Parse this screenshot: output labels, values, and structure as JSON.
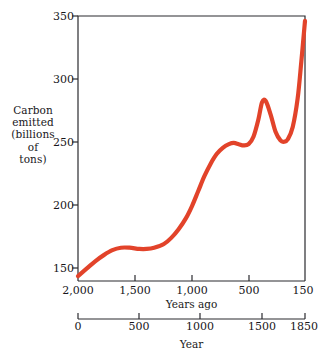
{
  "chart_data": {
    "type": "line",
    "title": "",
    "ylabel": "Carbon emitted (billions of tons)",
    "ylabel_lines": [
      "Carbon",
      "emitted",
      "(billions",
      "of",
      "tons)"
    ],
    "ylim": [
      137,
      352
    ],
    "yticks": [
      150,
      200,
      250,
      300,
      350
    ],
    "ytick_labels": [
      "150",
      "200",
      "250",
      "300",
      "350"
    ],
    "grid": false,
    "legend": null,
    "axes": [
      {
        "name": "years-ago",
        "position": "top-of-caption",
        "label": "Years ago",
        "ticks": [
          2000,
          1500,
          1000,
          500,
          150
        ],
        "tick_labels": [
          "2,000",
          "1,500",
          "1,000",
          "500",
          "150"
        ],
        "direction": "decreasing"
      },
      {
        "name": "year",
        "position": "bottom",
        "label": "Year",
        "ticks": [
          0,
          500,
          1000,
          1500,
          1850
        ],
        "tick_labels": [
          "0",
          "500",
          "1000",
          "1500",
          "1850"
        ],
        "direction": "increasing"
      }
    ],
    "series": [
      {
        "name": "Carbon emitted",
        "color": "#e2432a",
        "x_axis": "year",
        "x": [
          0,
          70,
          140,
          210,
          280,
          350,
          420,
          500,
          560,
          620,
          700,
          760,
          820,
          880,
          930,
          980,
          1030,
          1080,
          1130,
          1180,
          1230,
          1270,
          1310,
          1350,
          1390,
          1430,
          1470,
          1500,
          1530,
          1570,
          1610,
          1650,
          1680,
          1710,
          1750,
          1790,
          1820,
          1850
        ],
        "y": [
          141,
          147,
          153,
          158,
          162,
          164,
          164,
          163,
          163,
          164,
          167,
          172,
          179,
          188,
          198,
          210,
          222,
          232,
          240,
          245,
          248,
          249,
          248,
          247,
          248,
          254,
          268,
          282,
          283,
          272,
          258,
          251,
          250,
          252,
          262,
          285,
          315,
          348
        ]
      }
    ]
  }
}
